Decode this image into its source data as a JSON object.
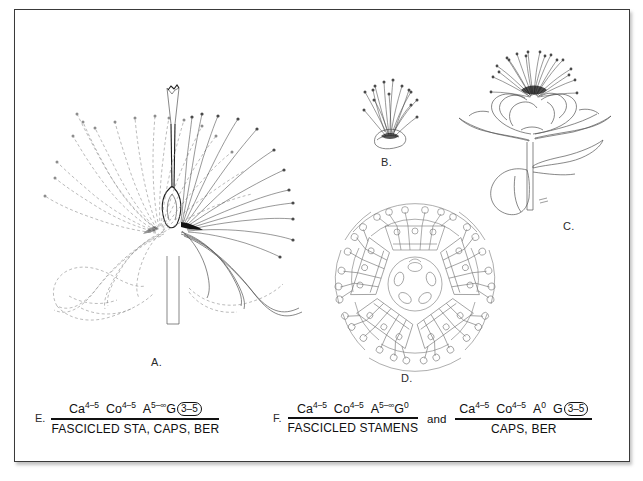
{
  "figure": {
    "kind": "botanical-plate",
    "background_color": "#ffffff",
    "frame_color": "#3a3a3a",
    "line_color": "#555555",
    "dashed_line_color": "#8d8d8d"
  },
  "panels": [
    {
      "id": "A",
      "label": "A.",
      "caption": "A.",
      "subject": "longitudinal-section-of-flower-with-fascicled-stamens"
    },
    {
      "id": "B",
      "label": "B.",
      "caption": "B.",
      "subject": "single-stamen-fascicle"
    },
    {
      "id": "C",
      "label": "C.",
      "caption": "C.",
      "subject": "whole-flowering-shoot-with-leaves"
    },
    {
      "id": "D",
      "label": "D.",
      "caption": "D.",
      "subject": "floral-diagram-five-stamen-fascicles"
    }
  ],
  "formulas": {
    "E": {
      "label": "E.",
      "numerator": {
        "parts": [
          {
            "symbol": "Ca",
            "superscript": "4–5"
          },
          {
            "symbol": "Co",
            "superscript": "4–5"
          },
          {
            "symbol": "A",
            "superscript": "5–∞"
          },
          {
            "symbol": "G",
            "superscript": "",
            "circled": "3–5"
          }
        ],
        "text": "Ca4–5 Co4–5 A5–∞ G (3–5)"
      },
      "denominator": "FASCICLED STA, CAPS, BER"
    },
    "F": {
      "label": "F.",
      "connector": "and",
      "first": {
        "numerator": {
          "parts": [
            {
              "symbol": "Ca",
              "superscript": "4–5"
            },
            {
              "symbol": "Co",
              "superscript": "4–5"
            },
            {
              "symbol": "A",
              "superscript": "5–∞"
            },
            {
              "symbol": "G",
              "superscript": "0"
            }
          ],
          "text": "Ca4–5 Co4–5 A5–∞ G0"
        },
        "denominator": "FASCICLED STAMENS"
      },
      "second": {
        "numerator": {
          "parts": [
            {
              "symbol": "Ca",
              "superscript": "4–5"
            },
            {
              "symbol": "Co",
              "superscript": "4–5"
            },
            {
              "symbol": "A",
              "superscript": "0"
            },
            {
              "symbol": "G",
              "superscript": "",
              "circled": "3–5"
            }
          ],
          "text": "Ca4–5 Co4–5 A0 G (3–5)"
        },
        "denominator": "CAPS, BER"
      }
    }
  }
}
